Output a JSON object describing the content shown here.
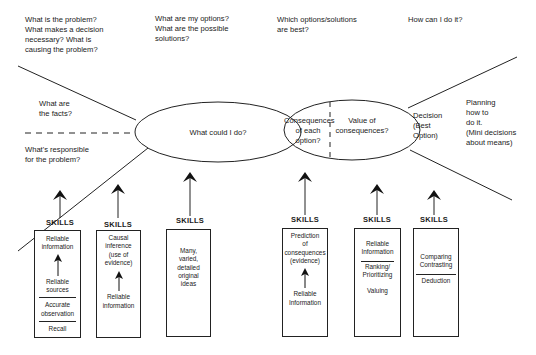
{
  "top_questions": [
    {
      "id": "problem",
      "text": "What is the problem?\nWhat makes a decision\nnecessary?   What is\ncausing the problem?"
    },
    {
      "id": "options",
      "text": "What are my options?\nWhat are the possible\nsolutions?"
    },
    {
      "id": "best",
      "text": "Which options/solutions\nare best?"
    },
    {
      "id": "how",
      "text": "How can I do it?"
    }
  ],
  "left_labels": {
    "facts": "What are\nthe facts?",
    "responsible": "What's responsible\nfor the problem?"
  },
  "ellipses": {
    "options": "What could I do?",
    "consequences": "Consequences\nof each option?",
    "value": "Value of\nconsequences?"
  },
  "right_labels": {
    "decision": "Decision\n(Best\nOption)",
    "planning": "Planning\nhow to\ndo it.\n(Mini decisions\nabout means)"
  },
  "skills_label": "SKILLS",
  "skill_boxes": [
    {
      "id": "facts",
      "items": [
        "Reliable\ninformation",
        "arrow",
        "Reliable\nsources",
        "rule",
        "Accurate\nobservation",
        "rule",
        "Recall"
      ]
    },
    {
      "id": "causes",
      "items": [
        "Causal\ninference\n(use of\nevidence)",
        "arrow",
        "Reliable\ninformation"
      ]
    },
    {
      "id": "options",
      "items": [
        "Many,\nvaried,\ndetailed\noriginal\nideas"
      ]
    },
    {
      "id": "consequences",
      "items": [
        "Prediction\nof\nconsequences\n(evidence)",
        "arrow",
        "Reliable\nInformation"
      ]
    },
    {
      "id": "value",
      "items": [
        "Reliable\nInformation",
        "rule",
        "Ranking/\nPrioritizing",
        "gap",
        "Valuing"
      ]
    },
    {
      "id": "decision",
      "items": [
        "Comparing\nContrasting",
        "rule",
        "Deduction"
      ]
    }
  ],
  "colors": {
    "line": "#222222",
    "background": "#ffffff",
    "text": "#1a1a1a"
  }
}
